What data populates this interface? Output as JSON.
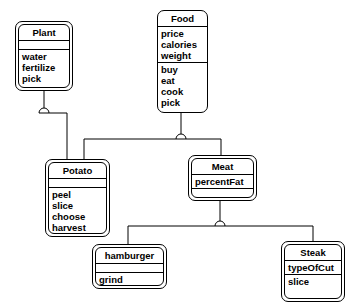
{
  "diagram": {
    "type": "class-diagram",
    "classes": {
      "plant": {
        "name": "Plant",
        "attributes": [],
        "operations": [
          "water",
          "fertilize",
          "pick"
        ]
      },
      "food": {
        "name": "Food",
        "attributes": [
          "price",
          "calories",
          "weight"
        ],
        "operations": [
          "buy",
          "eat",
          "cook",
          "pick"
        ]
      },
      "potato": {
        "name": "Potato",
        "attributes": [],
        "operations": [
          "peel",
          "slice",
          "choose",
          "harvest"
        ]
      },
      "meat": {
        "name": "Meat",
        "attributes": [
          "percentFat"
        ],
        "operations": []
      },
      "hamburger": {
        "name": "hamburger",
        "attributes": [],
        "operations": [
          "grind"
        ]
      },
      "steak": {
        "name": "Steak",
        "attributes": [
          "typeOfCut"
        ],
        "operations": [
          "slice"
        ]
      }
    },
    "relationships": [
      {
        "type": "inheritance",
        "parent": "Plant",
        "child": "Potato"
      },
      {
        "type": "inheritance",
        "parent": "Food",
        "child": "Potato"
      },
      {
        "type": "inheritance",
        "parent": "Food",
        "child": "Meat"
      },
      {
        "type": "inheritance",
        "parent": "Meat",
        "child": "hamburger"
      },
      {
        "type": "inheritance",
        "parent": "Meat",
        "child": "Steak"
      }
    ],
    "colors": {
      "line": "#000000",
      "background": "#ffffff"
    }
  }
}
